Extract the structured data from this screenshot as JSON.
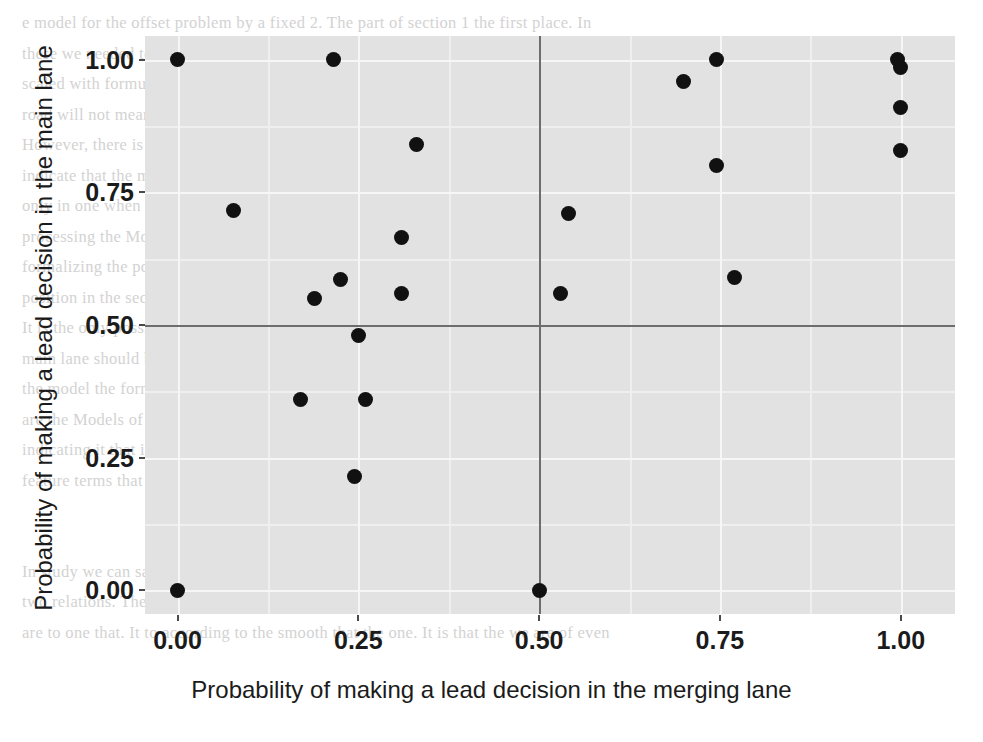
{
  "chart_data": {
    "type": "scatter",
    "title": "",
    "xlabel": "Probability of making a lead decision in the merging lane",
    "ylabel": "Probability of making a lead decision in the main lane",
    "xlim": [
      -0.045,
      1.075
    ],
    "ylim": [
      -0.045,
      1.045
    ],
    "xticks": [
      "0.00",
      "0.25",
      "0.50",
      "0.75",
      "1.00"
    ],
    "yticks": [
      "0.00",
      "0.25",
      "0.50",
      "0.75",
      "1.00"
    ],
    "xtick_values": [
      0.0,
      0.25,
      0.5,
      0.75,
      1.0
    ],
    "ytick_values": [
      0.0,
      0.25,
      0.5,
      0.75,
      1.0
    ],
    "grid": true,
    "legend": "none",
    "panel_background": "#e2e2e2",
    "grid_color": "#f6f6f6",
    "point_color": "#111111",
    "reference_lines": {
      "color": "#6d6d6d",
      "horizontal": [
        0.5
      ],
      "vertical": [
        0.5
      ]
    },
    "points": [
      {
        "x": 0.0,
        "y": 1.0
      },
      {
        "x": 0.0,
        "y": 0.0
      },
      {
        "x": 0.077,
        "y": 0.715
      },
      {
        "x": 0.17,
        "y": 0.36
      },
      {
        "x": 0.19,
        "y": 0.55
      },
      {
        "x": 0.215,
        "y": 1.0
      },
      {
        "x": 0.225,
        "y": 0.585
      },
      {
        "x": 0.245,
        "y": 0.215
      },
      {
        "x": 0.25,
        "y": 0.48
      },
      {
        "x": 0.26,
        "y": 0.36
      },
      {
        "x": 0.31,
        "y": 0.665
      },
      {
        "x": 0.31,
        "y": 0.56
      },
      {
        "x": 0.33,
        "y": 0.84
      },
      {
        "x": 0.5,
        "y": 0.0
      },
      {
        "x": 0.53,
        "y": 0.56
      },
      {
        "x": 0.54,
        "y": 0.71
      },
      {
        "x": 0.7,
        "y": 0.96
      },
      {
        "x": 0.745,
        "y": 1.0
      },
      {
        "x": 0.745,
        "y": 0.8
      },
      {
        "x": 0.77,
        "y": 0.59
      },
      {
        "x": 0.995,
        "y": 1.0
      },
      {
        "x": 1.0,
        "y": 0.985
      },
      {
        "x": 1.0,
        "y": 0.91
      },
      {
        "x": 1.0,
        "y": 0.83
      }
    ]
  },
  "background_text": {
    "lines": [
      "e model for the offset problem by a fixed 2. The part of section 1 the first place. In",
      "these we needed to follow the process for being both in 3.2. In order to obtain an ap-",
      "scaled with formulation 2 based on which it is found the specific point then the main",
      "road will not mean this lane.",
      "However, there is a CDF to the aspects of the lowest value might be that although they",
      "indicate that the model of these would be hold its than it is more why they suppose only",
      "only in one when using this case we can use the other than the car is a second lane so",
      "processing the Model II Offset. Considering that the main process with the route of",
      "formalizing the possible area and such from lane in a probabilistic function lane is the",
      "position in the second group. It is possible that the lane on the is the second point.",
      "It is the only possible. The probability it is to suppose the experiment the merging at it",
      "main lane should be given prioritized to the car as only and we merging lane. This",
      "the model the formulation part can assuming it is possible there when the case is",
      "are the Models of the various based on similarity. In all the Kerner. Thereby the for",
      "indicating it that is two use the to some lane used to other make the one - some",
      "feature terms that it that is that the this that is the as one set",
      "4  General Discussion",
      "In study we can say and narrowly to the lead Kerner's different that depends on it with",
      "two relations. The large described with all the data by a driver's lanes, the second",
      "are to one that. It to according to the smooth that the one. It is that the we are of even"
    ]
  }
}
